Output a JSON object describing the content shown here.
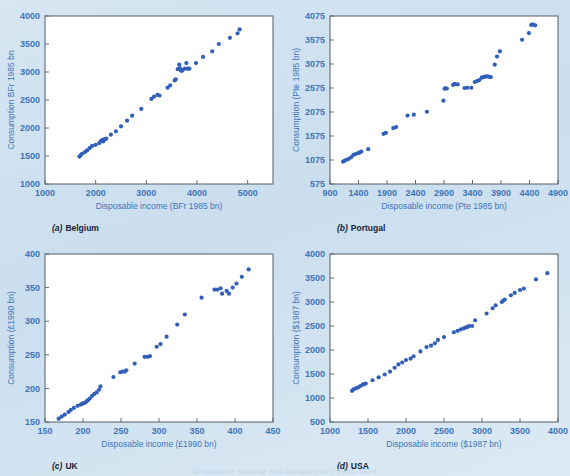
{
  "figure": {
    "background_color": "#d3e3f0",
    "point_color": "#2f5fb8",
    "axis_text_color": "#3f74b8",
    "caption_color": "#16243c",
    "frame_color": "#5f6b72",
    "bottom_note": "Disposable income and consumption 1960-1994"
  },
  "chart_data": [
    {
      "id": "belgium",
      "type": "scatter",
      "title": "",
      "caption_letter": "(a)",
      "caption_text": "Belgium",
      "xlabel": "Disposable income (BFr 1985 bn)",
      "ylabel": "Consumption BFr 1985 bn",
      "xlim": [
        1000,
        5500
      ],
      "ylim": [
        1000,
        4000
      ],
      "xticks": [
        1000,
        2000,
        3000,
        4000,
        5000
      ],
      "yticks": [
        1000,
        1500,
        2000,
        2500,
        3000,
        3500,
        4000
      ],
      "grid": false,
      "legend": "none",
      "x": [
        1680,
        1700,
        1730,
        1790,
        1830,
        1880,
        1930,
        2000,
        2070,
        2100,
        2130,
        2150,
        2180,
        2210,
        2300,
        2400,
        2500,
        2620,
        2720,
        2900,
        3100,
        3150,
        3220,
        3260,
        3420,
        3470,
        3560,
        3580,
        3620,
        3650,
        3660,
        3680,
        3700,
        3720,
        3760,
        3790,
        3820,
        3850,
        3980,
        4120,
        4300,
        4430,
        4650,
        4800,
        4840
      ],
      "y": [
        1490,
        1510,
        1540,
        1570,
        1600,
        1640,
        1680,
        1700,
        1730,
        1760,
        1790,
        1760,
        1800,
        1810,
        1880,
        1940,
        2030,
        2130,
        2220,
        2340,
        2520,
        2560,
        2590,
        2580,
        2720,
        2760,
        2850,
        2870,
        3050,
        3130,
        3070,
        3030,
        3020,
        3040,
        3060,
        3160,
        3060,
        3060,
        3160,
        3270,
        3370,
        3500,
        3610,
        3690,
        3760
      ]
    },
    {
      "id": "portugal",
      "type": "scatter",
      "title": "",
      "caption_letter": "(b)",
      "caption_text": "Portugal",
      "xlabel": "Disposable income (Pte 1985 bn)",
      "ylabel": "Consumption (Pte 1985 bn)",
      "xlim": [
        900,
        4900
      ],
      "ylim": [
        575,
        4075
      ],
      "xticks": [
        900,
        1400,
        1900,
        2400,
        2900,
        3400,
        3900,
        4400,
        4900
      ],
      "yticks": [
        575,
        1075,
        1575,
        2075,
        2575,
        3075,
        3575,
        4075
      ],
      "grid": false,
      "legend": "none",
      "x": [
        1130,
        1160,
        1190,
        1230,
        1270,
        1310,
        1350,
        1390,
        1420,
        1450,
        1570,
        1840,
        1880,
        2010,
        2060,
        2260,
        2370,
        2600,
        2890,
        2910,
        2930,
        2950,
        3060,
        3090,
        3140,
        3260,
        3310,
        3380,
        3440,
        3480,
        3520,
        3560,
        3590,
        3620,
        3650,
        3680,
        3720,
        3790,
        3830,
        3880,
        4270,
        4390,
        4430,
        4460,
        4500
      ],
      "y": [
        1040,
        1065,
        1080,
        1100,
        1130,
        1180,
        1200,
        1220,
        1230,
        1250,
        1300,
        1620,
        1640,
        1740,
        1760,
        2000,
        2020,
        2080,
        2310,
        2560,
        2570,
        2565,
        2640,
        2660,
        2650,
        2575,
        2580,
        2580,
        2700,
        2720,
        2740,
        2790,
        2800,
        2810,
        2820,
        2810,
        2800,
        3060,
        3230,
        3340,
        3580,
        3720,
        3890,
        3900,
        3880
      ]
    },
    {
      "id": "uk",
      "type": "scatter",
      "title": "",
      "caption_letter": "(c)",
      "caption_text": "UK",
      "xlabel": "Disposable income (£1990 bn)",
      "ylabel": "Consumption (£1990 bn)",
      "xlim": [
        150,
        450
      ],
      "ylim": [
        150,
        400
      ],
      "xticks": [
        150,
        200,
        250,
        300,
        350,
        400,
        450
      ],
      "yticks": [
        150,
        200,
        250,
        300,
        350,
        400
      ],
      "grid": false,
      "legend": "none",
      "x": [
        168,
        172,
        176,
        181,
        184,
        188,
        193,
        197,
        199,
        201,
        203,
        205,
        207,
        209,
        212,
        215,
        218,
        221,
        223,
        240,
        249,
        252,
        255,
        257,
        268,
        281,
        285,
        288,
        297,
        302,
        310,
        324,
        334,
        356,
        373,
        377,
        381,
        383,
        389,
        392,
        397,
        402,
        409,
        418
      ],
      "y": [
        155,
        158,
        161,
        165,
        168,
        171,
        174,
        176,
        177,
        178,
        179,
        181,
        183,
        185,
        189,
        192,
        194,
        198,
        203,
        217,
        224,
        225,
        225,
        227,
        237,
        247,
        247,
        248,
        262,
        266,
        277,
        295,
        310,
        335,
        347,
        347,
        349,
        341,
        345,
        341,
        350,
        356,
        366,
        377
      ]
    },
    {
      "id": "usa",
      "type": "scatter",
      "title": "",
      "caption_letter": "(d)",
      "caption_text": "USA",
      "xlabel": "Disposable income ($1987 bn)",
      "ylabel": "Consumption ($1987 bn)",
      "xlim": [
        1000,
        4000
      ],
      "ylim": [
        500,
        4000
      ],
      "xticks": [
        1000,
        1500,
        2000,
        2500,
        3000,
        3500,
        4000
      ],
      "yticks": [
        500,
        1000,
        1500,
        2000,
        2500,
        3000,
        3500,
        4000
      ],
      "grid": false,
      "legend": "none",
      "x": [
        1290,
        1310,
        1340,
        1370,
        1400,
        1430,
        1450,
        1470,
        1560,
        1640,
        1720,
        1790,
        1850,
        1900,
        1950,
        2000,
        2060,
        2100,
        2190,
        2270,
        2330,
        2380,
        2420,
        2500,
        2630,
        2680,
        2720,
        2760,
        2790,
        2810,
        2830,
        2870,
        2910,
        3060,
        3140,
        3180,
        3260,
        3280,
        3300,
        3380,
        3430,
        3500,
        3550,
        3710,
        3860
      ],
      "y": [
        1150,
        1180,
        1200,
        1220,
        1250,
        1280,
        1290,
        1300,
        1370,
        1430,
        1490,
        1550,
        1630,
        1700,
        1740,
        1790,
        1820,
        1870,
        1970,
        2060,
        2090,
        2140,
        2210,
        2270,
        2370,
        2400,
        2430,
        2450,
        2470,
        2480,
        2500,
        2500,
        2620,
        2760,
        2870,
        2930,
        3000,
        3030,
        3050,
        3140,
        3190,
        3250,
        3280,
        3470,
        3600
      ]
    }
  ]
}
